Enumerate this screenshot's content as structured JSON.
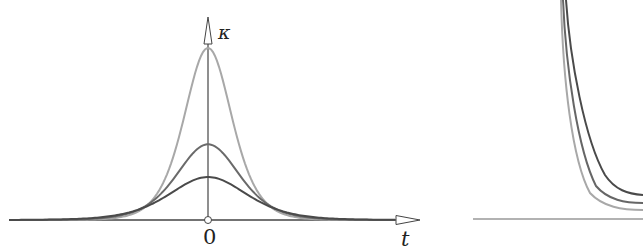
{
  "chart_data": [
    {
      "type": "line",
      "title": "",
      "xlabel": "t",
      "ylabel": "κ",
      "x_tick_labels": [
        "0"
      ],
      "grid": false,
      "legend": null,
      "description": "Three bell-shaped curvature profiles centered at t=0 with different peak heights",
      "series": [
        {
          "name": "light curve",
          "color": "#a8a8a8",
          "peak_relative": 1.0,
          "shape": "bell"
        },
        {
          "name": "medium curve",
          "color": "#6a6a6a",
          "peak_relative": 0.44,
          "shape": "bell"
        },
        {
          "name": "dark curve",
          "color": "#4a4a4a",
          "peak_relative": 0.25,
          "shape": "bell"
        }
      ]
    },
    {
      "type": "line",
      "title": "",
      "xlabel": "",
      "ylabel": "",
      "grid": false,
      "description": "Partial right panel: three nested curves decaying steeply toward a horizontal baseline",
      "series": [
        {
          "name": "dark curve",
          "color": "#4a4a4a",
          "shape": "decay"
        },
        {
          "name": "medium curve",
          "color": "#6a6a6a",
          "shape": "decay"
        },
        {
          "name": "light curve",
          "color": "#a8a8a8",
          "shape": "decay"
        }
      ]
    }
  ],
  "labels": {
    "y_axis": "κ",
    "x_axis": "t",
    "origin": "0"
  },
  "colors": {
    "light": "#a8a8a8",
    "medium": "#666666",
    "dark": "#4a4a4a",
    "axis": "#333333"
  }
}
